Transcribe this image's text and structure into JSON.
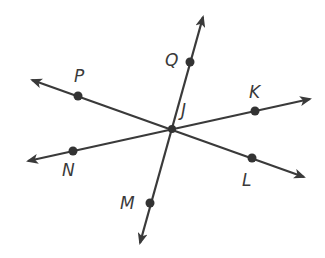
{
  "diagram": {
    "type": "intersecting-lines",
    "intersection": {
      "label": "J",
      "x": 172,
      "y": 129
    },
    "lines": [
      {
        "name": "line-QM",
        "from": [
          140,
          243
        ],
        "to": [
          203,
          17
        ],
        "points": [
          "Q",
          "J",
          "M"
        ]
      },
      {
        "name": "line-PL",
        "from": [
          32,
          80
        ],
        "to": [
          304,
          177
        ],
        "points": [
          "P",
          "J",
          "L"
        ]
      },
      {
        "name": "line-NK",
        "from": [
          28,
          161
        ],
        "to": [
          310,
          99
        ],
        "points": [
          "N",
          "J",
          "K"
        ]
      }
    ],
    "points": [
      {
        "label": "Q",
        "x": 190,
        "y": 62,
        "lx": 165,
        "ly": 66
      },
      {
        "label": "P",
        "x": 78,
        "y": 96,
        "lx": 74,
        "ly": 82
      },
      {
        "label": "K",
        "x": 255,
        "y": 111,
        "lx": 249,
        "ly": 98
      },
      {
        "label": "J",
        "x": 172,
        "y": 129,
        "lx": 181,
        "ly": 116
      },
      {
        "label": "N",
        "x": 73,
        "y": 151,
        "lx": 62,
        "ly": 176
      },
      {
        "label": "L",
        "x": 252,
        "y": 158,
        "lx": 242,
        "ly": 186
      },
      {
        "label": "M",
        "x": 150,
        "y": 203,
        "lx": 120,
        "ly": 209
      }
    ],
    "colors": {
      "stroke": "#3a3a3a",
      "dot": "#333333",
      "background": "#ffffff"
    }
  }
}
